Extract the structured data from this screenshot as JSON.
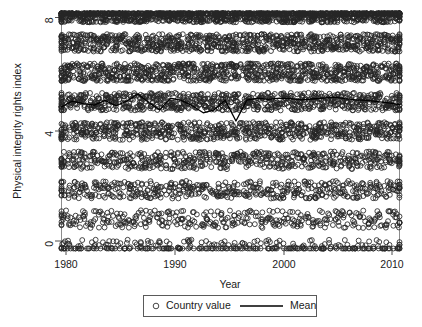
{
  "chart_data": {
    "type": "scatter",
    "title": "",
    "xlabel": "Year",
    "ylabel": "Physical integrity rights index",
    "xlim": [
      1980,
      2011
    ],
    "ylim": [
      0,
      8
    ],
    "xticks": [
      1980,
      1990,
      2000,
      2010
    ],
    "yticks": [
      0,
      4,
      8
    ],
    "xtick_labels": [
      "1980",
      "1990",
      "2000",
      "2010"
    ],
    "ytick_labels": [
      "0",
      "4",
      "8"
    ],
    "grid": false,
    "legend_position": "below-axes",
    "legend": [
      {
        "label": "Country value",
        "marker": "open-circle",
        "color": "#262626"
      },
      {
        "label": "Mean",
        "marker": "line",
        "color": "#000000"
      }
    ],
    "series": [
      {
        "name": "Country value",
        "type": "scatter",
        "marker": "open-circle",
        "note": "Integer-valued index 0-8 jittered vertically; one point per country-year, 1980-2011",
        "level_counts_per_year": {
          "8": 44,
          "7": 26,
          "6": 26,
          "5": 24,
          "4": 22,
          "3": 17,
          "2": 15,
          "1": 11,
          "0": 9
        }
      },
      {
        "name": "Mean",
        "type": "line",
        "x": [
          1980,
          1981,
          1982,
          1983,
          1984,
          1985,
          1986,
          1987,
          1988,
          1989,
          1990,
          1991,
          1992,
          1993,
          1994,
          1995,
          1996,
          1997,
          1998,
          1999,
          2000,
          2001,
          2002,
          2003,
          2004,
          2005,
          2006,
          2007,
          2008,
          2009,
          2010,
          2011
        ],
        "values": [
          4.82,
          5.02,
          4.93,
          4.88,
          5.04,
          4.86,
          5.02,
          5.26,
          4.97,
          4.72,
          5.12,
          5.04,
          4.86,
          4.62,
          4.72,
          5.05,
          4.34,
          5.05,
          5.12,
          5.08,
          5.12,
          5.1,
          5.06,
          5.09,
          5.12,
          5.15,
          5.1,
          5.06,
          5.04,
          5.0,
          4.96,
          4.9
        ]
      }
    ]
  },
  "axes": {
    "xlabel": "Year",
    "ylabel": "Physical integrity rights index"
  },
  "legend": {
    "country_value_label": "Country value",
    "mean_label": "Mean"
  }
}
